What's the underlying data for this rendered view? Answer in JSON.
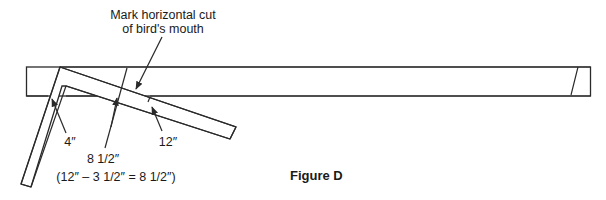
{
  "figure": {
    "caption": "Figure D",
    "labels": {
      "mark_line1": "Mark horizontal cut",
      "mark_line2": "of bird's mouth",
      "tongue_measure": "4″",
      "blade_measure": "12″",
      "cut_measure": "8 1/2″",
      "cut_formula": "(12″ – 3 1/2″ = 8 1/2″)"
    },
    "components": [
      "rafter-board",
      "framing-square"
    ],
    "colors": {
      "ink": "#2a2a2a",
      "background": "#ffffff"
    }
  }
}
